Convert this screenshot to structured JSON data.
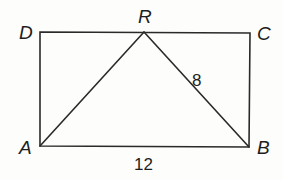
{
  "diagram": {
    "type": "geometry",
    "points": {
      "A": {
        "label": "A",
        "x": 40,
        "y": 146
      },
      "B": {
        "label": "B",
        "x": 249,
        "y": 147
      },
      "C": {
        "label": "C",
        "x": 250,
        "y": 33
      },
      "D": {
        "label": "D",
        "x": 40,
        "y": 32
      },
      "R": {
        "label": "R",
        "x": 144,
        "y": 32
      }
    },
    "segments": [
      {
        "from": "A",
        "to": "B",
        "label": "12"
      },
      {
        "from": "B",
        "to": "C",
        "label": ""
      },
      {
        "from": "C",
        "to": "D",
        "label": ""
      },
      {
        "from": "D",
        "to": "A",
        "label": ""
      },
      {
        "from": "A",
        "to": "R",
        "label": ""
      },
      {
        "from": "R",
        "to": "B",
        "label": "8"
      }
    ],
    "labels": {
      "A": "A",
      "B": "B",
      "C": "C",
      "D": "D",
      "R": "R",
      "AB_length": "12",
      "RB_length": "8"
    },
    "colors": {
      "line": "#2a2a2a",
      "text": "#1e1e1e",
      "background": "#fdfdfb"
    }
  }
}
